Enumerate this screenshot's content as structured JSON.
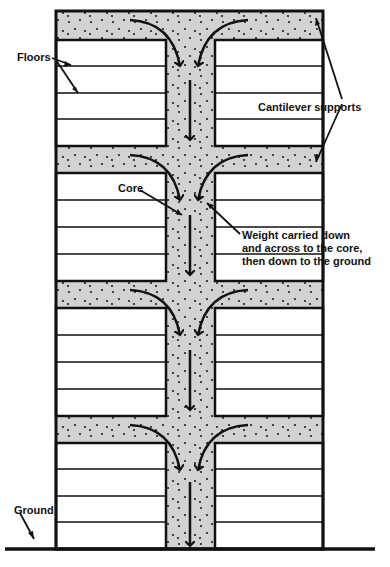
{
  "diagram": {
    "colors": {
      "background": "#ffffff",
      "outline": "#111111",
      "concrete_fill": "#d2d2d2",
      "stipple": "#222222",
      "floor_fill": "#ffffff"
    },
    "labels": {
      "floors": "Floors",
      "cantilever_supports": "Cantilever supports",
      "core": "Core",
      "weight_line1": "Weight carried down",
      "weight_line2": "and across to the core,",
      "weight_line3": "then down to the ground",
      "ground": "Ground"
    },
    "structure": {
      "levels": 4,
      "floors_per_level": 4,
      "components": [
        "cantilever slab",
        "core",
        "floors",
        "ground"
      ]
    }
  }
}
